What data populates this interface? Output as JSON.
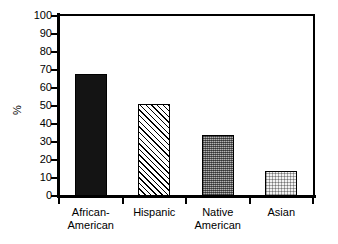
{
  "chart_data": {
    "type": "bar",
    "title": "",
    "subtitle": "",
    "xlabel": "",
    "ylabel": "%",
    "ylim": [
      0,
      100
    ],
    "ytick_values": [
      0,
      10,
      20,
      30,
      40,
      50,
      60,
      70,
      80,
      90,
      100
    ],
    "ytick_labels": [
      "0",
      "10",
      "20",
      "30",
      "40",
      "50",
      "60",
      "70",
      "80",
      "90",
      "100"
    ],
    "grid": false,
    "legend": "none",
    "categories": [
      "African-American",
      "Hispanic",
      "Native American",
      "Asian"
    ],
    "category_lines": [
      [
        "African-",
        "American"
      ],
      [
        "Hispanic",
        ""
      ],
      [
        "Native",
        "American"
      ],
      [
        "Asian",
        ""
      ]
    ],
    "values": [
      68,
      51,
      34,
      14
    ],
    "bar_fills": [
      "solid-black",
      "diagonal-hatch",
      "dense-stipple-gray",
      "light-dots"
    ],
    "colors": {
      "axis": "#000000",
      "bar_solid": "#141414",
      "bar_hatch_line": "#000000",
      "bar_stipple": "#b3b3b3",
      "bar_dots": "#f2f2f2",
      "background": "#ffffff"
    }
  }
}
